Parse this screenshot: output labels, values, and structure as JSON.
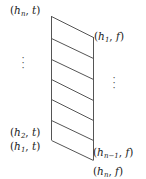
{
  "diagram": {
    "type": "slanted ladder / strip diagram",
    "stroke_color": "#555555",
    "left_column": {
      "x": 51,
      "top_y": 16,
      "bottom_y": 140
    },
    "right_column": {
      "x": 93,
      "top_y": 37,
      "bottom_y": 160
    },
    "rungs_left_y": [
      16,
      38,
      59,
      79,
      99,
      120,
      140
    ],
    "rungs_right_y": [
      37,
      58,
      79,
      100,
      120,
      140,
      160
    ],
    "labels": {
      "top_left": {
        "base": "h",
        "sub": "n",
        "value": "t"
      },
      "top_right": {
        "base": "h",
        "sub": "1",
        "value": "f"
      },
      "left_second": {
        "base": "h",
        "sub": "2",
        "value": "t"
      },
      "left_bottom": {
        "base": "h",
        "sub": "1",
        "value": "t"
      },
      "right_second": {
        "base": "h",
        "sub": "n−1",
        "value": "f"
      },
      "right_bottom": {
        "base": "h",
        "sub": "n",
        "value": "f"
      }
    },
    "ellipsis_left": "⋮",
    "ellipsis_right": "⋮",
    "punct": {
      "open": "(",
      "comma": ",",
      "close": ")"
    }
  }
}
